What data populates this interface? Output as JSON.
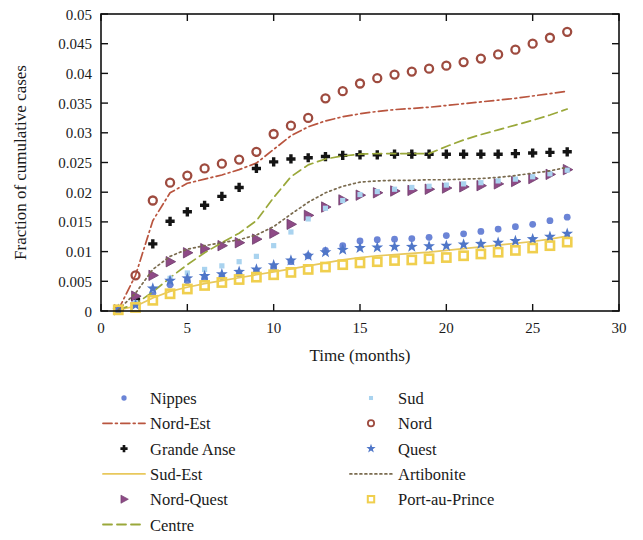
{
  "chart_data": {
    "type": "scatter",
    "title": "",
    "xlabel": "Time (months)",
    "ylabel": "Fraction of cumulative cases",
    "xlim": [
      0,
      30
    ],
    "ylim": [
      0,
      0.05
    ],
    "xticks": [
      0,
      5,
      10,
      15,
      20,
      25,
      30
    ],
    "xtick_labels": [
      "0",
      "5",
      "10",
      "15",
      "20",
      "25",
      "30"
    ],
    "yticks": [
      0,
      0.005,
      0.01,
      0.015,
      0.02,
      0.025,
      0.03,
      0.035,
      0.04,
      0.045,
      0.05
    ],
    "ytick_labels": [
      "0",
      "0.005",
      "0.01",
      "0.015",
      "0.02",
      "0.025",
      "0.03",
      "0.035",
      "0.04",
      "0.045",
      "0.05"
    ],
    "grid": false,
    "legend_position": "below-two-columns",
    "x": [
      1,
      2,
      3,
      4,
      5,
      6,
      7,
      8,
      9,
      10,
      11,
      12,
      13,
      14,
      15,
      16,
      17,
      18,
      19,
      20,
      21,
      22,
      23,
      24,
      25,
      26,
      27
    ],
    "series": [
      {
        "name": "Nippes",
        "style": "markers",
        "marker": "circle-filled",
        "color": "#6b84d6",
        "values": [
          0.0002,
          0.0013,
          0.003,
          0.0044,
          0.0051,
          0.0055,
          0.0058,
          0.0062,
          0.0067,
          0.0074,
          0.0083,
          0.0093,
          0.0102,
          0.011,
          0.0118,
          0.012,
          0.0121,
          0.0122,
          0.0124,
          0.0127,
          0.013,
          0.0134,
          0.0138,
          0.0142,
          0.0146,
          0.0152,
          0.0158
        ]
      },
      {
        "name": "Nord-Est",
        "style": "line",
        "dash": "dash-dot",
        "color": "#b9553f",
        "values": [
          0.0002,
          0.006,
          0.0152,
          0.0199,
          0.0215,
          0.0222,
          0.0229,
          0.0238,
          0.0249,
          0.0272,
          0.0295,
          0.031,
          0.032,
          0.0327,
          0.0332,
          0.0336,
          0.0339,
          0.0341,
          0.0343,
          0.0346,
          0.0349,
          0.0352,
          0.0355,
          0.0358,
          0.0362,
          0.0366,
          0.037
        ]
      },
      {
        "name": "Grande Anse",
        "style": "markers",
        "marker": "plus-filled",
        "color": "#141414",
        "values": [
          0.0002,
          0.002,
          0.0113,
          0.0151,
          0.0167,
          0.0178,
          0.0193,
          0.0208,
          0.024,
          0.0251,
          0.0256,
          0.0258,
          0.026,
          0.0262,
          0.0263,
          0.0263,
          0.0264,
          0.0264,
          0.0264,
          0.0264,
          0.0264,
          0.0264,
          0.0264,
          0.0265,
          0.0266,
          0.0267,
          0.0268
        ]
      },
      {
        "name": "Sud-Est",
        "style": "line",
        "dash": "solid",
        "color": "#e8c85c",
        "values": [
          0.0002,
          0.0008,
          0.0022,
          0.0033,
          0.004,
          0.0046,
          0.0051,
          0.0056,
          0.0061,
          0.0066,
          0.0071,
          0.0076,
          0.0081,
          0.0086,
          0.009,
          0.0093,
          0.0095,
          0.0097,
          0.0099,
          0.0102,
          0.0105,
          0.0108,
          0.0111,
          0.0114,
          0.0117,
          0.0121,
          0.0126
        ]
      },
      {
        "name": "Nord-Quest",
        "style": "markers",
        "marker": "triangle-right",
        "color": "#8e4a86",
        "values": [
          0.0002,
          0.0025,
          0.006,
          0.0083,
          0.0098,
          0.0105,
          0.011,
          0.0115,
          0.0121,
          0.0131,
          0.0146,
          0.0161,
          0.0175,
          0.0187,
          0.0195,
          0.0199,
          0.0202,
          0.0203,
          0.0205,
          0.0207,
          0.0209,
          0.0211,
          0.0214,
          0.0218,
          0.0223,
          0.023,
          0.0238
        ]
      },
      {
        "name": "Centre",
        "style": "line",
        "dash": "dashed",
        "color": "#9aa83a",
        "values": [
          0.0002,
          0.0012,
          0.0032,
          0.0056,
          0.0078,
          0.0098,
          0.0115,
          0.0131,
          0.0152,
          0.0191,
          0.0226,
          0.0246,
          0.0256,
          0.0261,
          0.0264,
          0.0265,
          0.0265,
          0.0265,
          0.0265,
          0.0277,
          0.0288,
          0.0297,
          0.0305,
          0.0313,
          0.0321,
          0.033,
          0.034
        ]
      },
      {
        "name": "Sud",
        "style": "markers",
        "marker": "square-small",
        "color": "#a9d3ef",
        "values": [
          0.0002,
          0.0014,
          0.0037,
          0.0055,
          0.0064,
          0.007,
          0.0076,
          0.0083,
          0.0092,
          0.011,
          0.0133,
          0.0155,
          0.0173,
          0.0186,
          0.0196,
          0.0201,
          0.0205,
          0.0208,
          0.021,
          0.0212,
          0.0214,
          0.0216,
          0.0219,
          0.0222,
          0.0226,
          0.0231,
          0.0237
        ]
      },
      {
        "name": "Nord",
        "style": "markers",
        "marker": "circle-open",
        "color": "#9e4b3f",
        "values": [
          0.0002,
          0.006,
          0.0186,
          0.0216,
          0.0228,
          0.024,
          0.0248,
          0.0255,
          0.0268,
          0.0298,
          0.0312,
          0.0325,
          0.0358,
          0.037,
          0.0383,
          0.0392,
          0.0398,
          0.0403,
          0.0408,
          0.0413,
          0.0419,
          0.0425,
          0.0432,
          0.044,
          0.045,
          0.046,
          0.047
        ]
      },
      {
        "name": "Quest",
        "style": "markers",
        "marker": "star",
        "color": "#4f76c8",
        "values": [
          0.0002,
          0.001,
          0.0038,
          0.0051,
          0.0055,
          0.0059,
          0.0062,
          0.0066,
          0.007,
          0.0077,
          0.0085,
          0.0093,
          0.0099,
          0.0103,
          0.0106,
          0.0107,
          0.0108,
          0.0108,
          0.0109,
          0.011,
          0.0112,
          0.0113,
          0.0115,
          0.0118,
          0.0121,
          0.0125,
          0.013
        ]
      },
      {
        "name": "Artibonite",
        "style": "line",
        "dash": "dotted",
        "color": "#7a6b4f",
        "values": [
          0.0002,
          0.003,
          0.007,
          0.0092,
          0.0104,
          0.011,
          0.0115,
          0.012,
          0.0128,
          0.0142,
          0.0163,
          0.0183,
          0.0199,
          0.021,
          0.0217,
          0.0219,
          0.022,
          0.022,
          0.0221,
          0.0221,
          0.0222,
          0.0223,
          0.0225,
          0.0228,
          0.0232,
          0.0236,
          0.0242
        ]
      },
      {
        "name": "Port-au-Prince",
        "style": "markers",
        "marker": "square-open",
        "color": "#f0cf4e",
        "values": [
          0.0002,
          0.0006,
          0.0018,
          0.0029,
          0.0037,
          0.0043,
          0.0048,
          0.0053,
          0.0057,
          0.0061,
          0.0065,
          0.007,
          0.0074,
          0.0078,
          0.0081,
          0.0083,
          0.0085,
          0.0086,
          0.0088,
          0.009,
          0.0093,
          0.0096,
          0.0099,
          0.0102,
          0.0106,
          0.011,
          0.0116
        ]
      }
    ]
  },
  "legend": {
    "column_left": [
      {
        "label": "Nippes",
        "key": "Nippes"
      },
      {
        "label": "Nord-Est",
        "key": "Nord-Est"
      },
      {
        "label": "Grande Anse",
        "key": "Grande Anse"
      },
      {
        "label": "Sud-Est",
        "key": "Sud-Est"
      },
      {
        "label": "Nord-Quest",
        "key": "Nord-Quest"
      },
      {
        "label": "Centre",
        "key": "Centre"
      }
    ],
    "column_right": [
      {
        "label": "Sud",
        "key": "Sud"
      },
      {
        "label": "Nord",
        "key": "Nord"
      },
      {
        "label": "Quest",
        "key": "Quest"
      },
      {
        "label": "Artibonite",
        "key": "Artibonite"
      },
      {
        "label": "Port-au-Prince",
        "key": "Port-au-Prince"
      }
    ]
  }
}
